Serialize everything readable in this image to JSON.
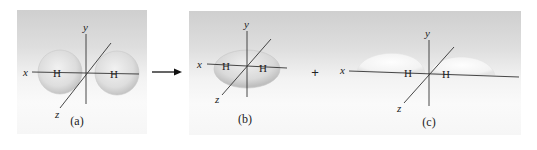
{
  "figure": {
    "panels": [
      {
        "id": "a",
        "caption": "(a)",
        "atom_labels": [
          "H",
          "H"
        ],
        "axis_labels": {
          "x": "x",
          "y": "y",
          "z": "z"
        },
        "shape": "two separate spherical orbitals"
      },
      {
        "id": "b",
        "caption": "(b)",
        "atom_labels": [
          "H",
          "H"
        ],
        "axis_labels": {
          "x": "x",
          "y": "y",
          "z": "z"
        },
        "shape": "single ellipsoidal orbital"
      },
      {
        "id": "c",
        "caption": "(c)",
        "atom_labels": [
          "H",
          "H"
        ],
        "axis_labels": {
          "x": "x",
          "y": "y",
          "z": "z"
        },
        "shape": "two lobes with node at origin"
      }
    ],
    "operators": {
      "arrow": "→",
      "plus": "+"
    }
  },
  "colors": {
    "axis": "#333333",
    "orbital_fill": "#e2e2e2",
    "background_top": "#cfcfcf",
    "background_bottom": "#f6f6f6"
  }
}
